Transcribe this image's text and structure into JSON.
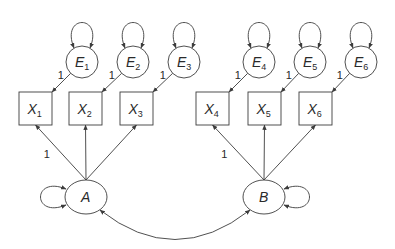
{
  "diagram": {
    "type": "structural-equation-model",
    "colors": {
      "stroke": "#3c3c3c",
      "text": "#2a2a2a",
      "background": "#ffffff"
    },
    "errors": [
      {
        "id": "E1",
        "letter": "E",
        "sub": "1",
        "cx": 82,
        "cy": 62,
        "loading": "1"
      },
      {
        "id": "E2",
        "letter": "E",
        "sub": "2",
        "cx": 133,
        "cy": 62,
        "loading": "1"
      },
      {
        "id": "E3",
        "letter": "E",
        "sub": "3",
        "cx": 184,
        "cy": 62,
        "loading": "1"
      },
      {
        "id": "E4",
        "letter": "E",
        "sub": "4",
        "cx": 259,
        "cy": 62,
        "loading": "1"
      },
      {
        "id": "E5",
        "letter": "E",
        "sub": "5",
        "cx": 310,
        "cy": 62,
        "loading": "1"
      },
      {
        "id": "E6",
        "letter": "E",
        "sub": "6",
        "cx": 361,
        "cy": 62,
        "loading": "1"
      }
    ],
    "observed": [
      {
        "id": "X1",
        "letter": "X",
        "sub": "1",
        "x": 19,
        "y": 92
      },
      {
        "id": "X2",
        "letter": "X",
        "sub": "2",
        "x": 69,
        "y": 92
      },
      {
        "id": "X3",
        "letter": "X",
        "sub": "3",
        "x": 120,
        "y": 92
      },
      {
        "id": "X4",
        "letter": "X",
        "sub": "4",
        "x": 196,
        "y": 92
      },
      {
        "id": "X5",
        "letter": "X",
        "sub": "5",
        "x": 248,
        "y": 92
      },
      {
        "id": "X6",
        "letter": "X",
        "sub": "6",
        "x": 299,
        "y": 92
      }
    ],
    "latent": [
      {
        "id": "A",
        "label": "A",
        "cx": 86,
        "cy": 197,
        "fixed_loading": "1",
        "indicators": [
          "X1",
          "X2",
          "X3"
        ]
      },
      {
        "id": "B",
        "label": "B",
        "cx": 264,
        "cy": 197,
        "fixed_loading": "1",
        "indicators": [
          "X4",
          "X5",
          "X6"
        ]
      }
    ],
    "covariance": {
      "from": "A",
      "to": "B"
    }
  }
}
